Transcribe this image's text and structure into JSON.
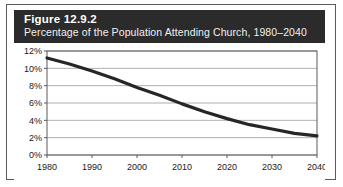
{
  "figure": {
    "label": "Figure 12.9.2",
    "subtitle": "Percentage of the Population Attending Church, 1980–2040"
  },
  "colors": {
    "header_background": "#2b2b2b",
    "header_text": "#ffffff",
    "line": "#262626",
    "grid": "#9a9a9a",
    "frame": "#5a5a5a",
    "plot_background": "#ffffff"
  },
  "chart_data": {
    "type": "line",
    "title": "Percentage of the Population Attending Church, 1980–2040",
    "xlabel": "",
    "ylabel": "",
    "x": [
      1980,
      1985,
      1990,
      1995,
      2000,
      2005,
      2010,
      2015,
      2020,
      2025,
      2030,
      2035,
      2040
    ],
    "values": [
      11.2,
      10.5,
      9.7,
      8.8,
      7.8,
      6.9,
      5.9,
      5.0,
      4.2,
      3.5,
      3.0,
      2.5,
      2.2
    ],
    "series": [
      {
        "name": "Percentage of the Population Attending Church",
        "values": [
          11.2,
          10.5,
          9.7,
          8.8,
          7.8,
          6.9,
          5.9,
          5.0,
          4.2,
          3.5,
          3.0,
          2.5,
          2.2
        ]
      }
    ],
    "xlim": [
      1980,
      2040
    ],
    "ylim": [
      0,
      12
    ],
    "xticks": [
      1980,
      1990,
      2000,
      2010,
      2020,
      2030,
      2040
    ],
    "xticklabels": [
      "1980",
      "1990",
      "2000",
      "2010",
      "2020",
      "2030",
      "2040"
    ],
    "yticks": [
      0,
      2,
      4,
      6,
      8,
      10,
      12
    ],
    "yticklabels": [
      "0%",
      "2%",
      "4%",
      "6%",
      "8%",
      "10%",
      "12%"
    ],
    "grid": true,
    "grid_axis": "y",
    "legend": false,
    "legend_position": "none"
  }
}
